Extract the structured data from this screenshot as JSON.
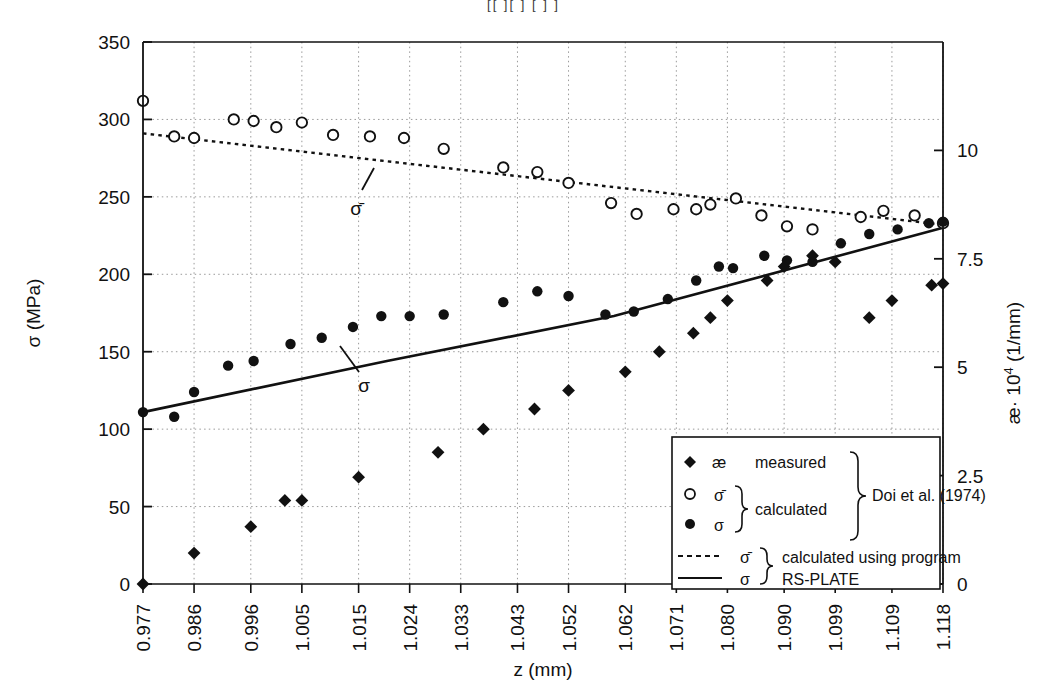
{
  "figure": {
    "top_partial_text": "[[  ][   ]   [   ]  ]",
    "background_color": "#ffffff",
    "foreground_color": "#111111"
  },
  "axes": {
    "left": {
      "title": "σ  (MPa)",
      "ticks": [
        "0",
        "50",
        "100",
        "150",
        "200",
        "250",
        "300",
        "350"
      ],
      "min": 0,
      "max": 350
    },
    "right": {
      "title": "æ· 10",
      "title_sup": "4",
      "title_unit": " (1/mm)",
      "ticks": [
        "0",
        "2.5",
        "5",
        "7.5",
        "10"
      ],
      "min": 0,
      "max": 12.5
    },
    "bottom": {
      "title": "z (mm)",
      "ticks": [
        "0.977",
        "0.986",
        "0.996",
        "1.005",
        "1.015",
        "1.024",
        "1.033",
        "1.043",
        "1.052",
        "1.062",
        "1.071",
        "1.080",
        "1.090",
        "1.099",
        "1.109",
        "1.118"
      ]
    }
  },
  "annotations": [
    {
      "name": "sigma-bar-callout",
      "label": "σ̄",
      "x": 0.3,
      "y": 267
    },
    {
      "name": "sigma-callout",
      "label": "σ",
      "x": 0.255,
      "y": 133
    }
  ],
  "legend": {
    "rows": [
      {
        "marker": "filled-diamond",
        "symbol": "æ",
        "text": "measured"
      },
      {
        "marker": "open-circle",
        "symbol": "σ̄",
        "text": "calculated"
      },
      {
        "marker": "filled-circle",
        "symbol": "σ",
        "text": ""
      },
      {
        "marker": "dashed-line",
        "symbol": "σ̄",
        "text": "calculated using program"
      },
      {
        "marker": "solid-line",
        "symbol": "σ",
        "text": "RS-PLATE"
      }
    ],
    "group_label_source": "Doi et al. (1974)",
    "group_label_calculated": "calculated",
    "group_label_program_line1": "calculated using program",
    "group_label_program_line2": "RS-PLATE"
  },
  "chart_data": {
    "type": "scatter",
    "title": "",
    "xlabel": "z (mm)",
    "ylabel": "σ  (MPa)",
    "ylabel_right": "æ· 10^4 (1/mm)",
    "xlim": [
      0.977,
      1.118
    ],
    "ylim": [
      0,
      350
    ],
    "ylim_right": [
      0,
      12.5
    ],
    "grid": true,
    "legend_position": "lower-right-inside",
    "series": [
      {
        "name": "æ measured (Doi et al. 1974)",
        "marker": "filled-diamond",
        "axis": "right",
        "x": [
          0.977,
          0.986,
          0.996,
          1.002,
          1.005,
          1.015,
          1.029,
          1.037,
          1.046,
          1.052,
          1.062,
          1.068,
          1.074,
          1.077,
          1.08,
          1.087,
          1.09,
          1.095,
          1.099,
          1.105,
          1.109,
          1.116,
          1.118
        ],
        "y_mpa": [
          0,
          20,
          37,
          54,
          54,
          69,
          85,
          100,
          113,
          125,
          137,
          150,
          162,
          172,
          183,
          196,
          205,
          212,
          208,
          172,
          183,
          193,
          194
        ]
      },
      {
        "name": "σ̄ calculated (Doi et al. 1974)",
        "marker": "open-circle",
        "axis": "left",
        "x": [
          0.977,
          0.9825,
          0.986,
          0.993,
          0.9965,
          1.0005,
          1.005,
          1.0105,
          1.017,
          1.023,
          1.03,
          1.0405,
          1.0465,
          1.052,
          1.0595,
          1.064,
          1.0705,
          1.0745,
          1.077,
          1.0815,
          1.086,
          1.0905,
          1.095,
          1.1035,
          1.1075,
          1.113,
          1.118
        ],
        "y": [
          312,
          289,
          288,
          300,
          299,
          295,
          298,
          290,
          289,
          288,
          281,
          269,
          266,
          259,
          246,
          239,
          242,
          242,
          245,
          249,
          238,
          231,
          229,
          237,
          241,
          238,
          233
        ]
      },
      {
        "name": "σ calculated (Doi et al. 1974)",
        "marker": "filled-circle",
        "axis": "left",
        "x": [
          0.977,
          0.9825,
          0.986,
          0.992,
          0.9965,
          1.003,
          1.0085,
          1.014,
          1.019,
          1.024,
          1.03,
          1.0405,
          1.0465,
          1.052,
          1.0585,
          1.0635,
          1.0695,
          1.0745,
          1.0785,
          1.081,
          1.0865,
          1.0905,
          1.095,
          1.1,
          1.105,
          1.11,
          1.1155,
          1.118
        ],
        "y": [
          111,
          108,
          124,
          141,
          144,
          155,
          159,
          166,
          173,
          173,
          174,
          182,
          189,
          186,
          174,
          176,
          184,
          196,
          205,
          204,
          212,
          209,
          208,
          220,
          226,
          229,
          233,
          234
        ]
      },
      {
        "name": "σ̄ calculated using program RS-PLATE",
        "marker": "dashed-line",
        "axis": "left",
        "x": [
          0.977,
          1.118
        ],
        "y": [
          291,
          232
        ]
      },
      {
        "name": "σ calculated using program RS-PLATE",
        "marker": "solid-line",
        "axis": "left",
        "x": [
          0.977,
          1.02,
          1.06,
          1.118
        ],
        "y": [
          111,
          144,
          173,
          230
        ]
      }
    ]
  }
}
